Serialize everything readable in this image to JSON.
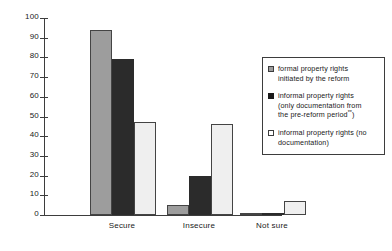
{
  "chart_data": {
    "type": "bar",
    "title": "",
    "xlabel": "",
    "ylabel": "",
    "ylim": [
      0,
      100
    ],
    "yticks": [
      0,
      10,
      20,
      30,
      40,
      50,
      60,
      70,
      80,
      90,
      100
    ],
    "grid": false,
    "legend_position": "right",
    "categories": [
      "Secure",
      "Insecure",
      "Not sure"
    ],
    "series": [
      {
        "name": "formal property rights initiated by the reform",
        "color": "#9d9d9d",
        "values": [
          94,
          5,
          0.5
        ]
      },
      {
        "name": "informal property rights (only documentation from the pre-reform period**)",
        "color": "#2b2b2b",
        "values": [
          79,
          20,
          1
        ]
      },
      {
        "name": "informal property rights (no documentation)",
        "color": "#efefef",
        "values": [
          47,
          46,
          7
        ]
      }
    ]
  },
  "axis": {
    "tick_labels": [
      "100",
      "90",
      "80",
      "70",
      "60",
      "50",
      "40",
      "30",
      "20",
      "10",
      "0"
    ]
  },
  "categories": [
    {
      "label": "Secure"
    },
    {
      "label": "Insecure"
    },
    {
      "label": "Not sure"
    }
  ],
  "legend": {
    "entries": [
      {
        "line1": "formal property rights",
        "line2": "initiated by the reform",
        "line3": "",
        "swatch": "gray-swatch"
      },
      {
        "line1": "informal property rights",
        "line2": "(only documentation from",
        "line3": "the pre-reform period",
        "superscript": "**",
        "line3_tail": ")",
        "swatch": "black-swatch"
      },
      {
        "line1": "informal property rights (no",
        "line2": "documentation)",
        "line3": "",
        "swatch": "white-swatch"
      }
    ]
  }
}
